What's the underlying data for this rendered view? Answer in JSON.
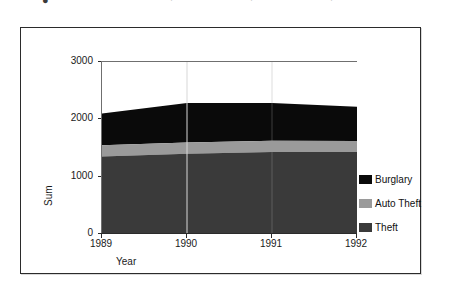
{
  "artifact": {
    "top_sliver_glyph": "●",
    "top_sliver_faint_1": "·",
    "top_sliver_faint_2": "·",
    "top_sliver_faint_3": "·"
  },
  "chart_data": {
    "type": "area",
    "title": "",
    "subtitle": "",
    "xlabel": "Year",
    "ylabel": "Sum",
    "x": [
      1989,
      1990,
      1991,
      1992
    ],
    "xtick_labels": [
      "1989",
      "1990",
      "1991",
      "1992"
    ],
    "ytick_labels": [
      "0",
      "1000",
      "2000",
      "3000"
    ],
    "ytick_values": [
      0,
      1000,
      2000,
      3000
    ],
    "xlim": [
      1989,
      1992
    ],
    "ylim": [
      0,
      3000
    ],
    "stacked": true,
    "grid": "vertical-faint",
    "legend_position": "inside-right",
    "series": [
      {
        "name": "Theft",
        "color": "#3a3a3a",
        "values": [
          1350,
          1400,
          1430,
          1430
        ]
      },
      {
        "name": "Auto Theft",
        "color": "#9a9a9a",
        "values": [
          200,
          195,
          195,
          190
        ]
      },
      {
        "name": "Burglary",
        "color": "#0a0a0a",
        "values": [
          550,
          690,
          660,
          600
        ]
      }
    ],
    "cumulative_tops": {
      "theft": [
        1350,
        1400,
        1430,
        1430
      ],
      "theft_plus_auto": [
        1550,
        1595,
        1625,
        1620
      ],
      "total": [
        2100,
        2285,
        2285,
        2220
      ]
    },
    "legend": [
      {
        "label": "Burglary",
        "color": "#0a0a0a"
      },
      {
        "label": "Auto Theft",
        "color": "#9a9a9a"
      },
      {
        "label": "Theft",
        "color": "#3a3a3a"
      }
    ]
  }
}
